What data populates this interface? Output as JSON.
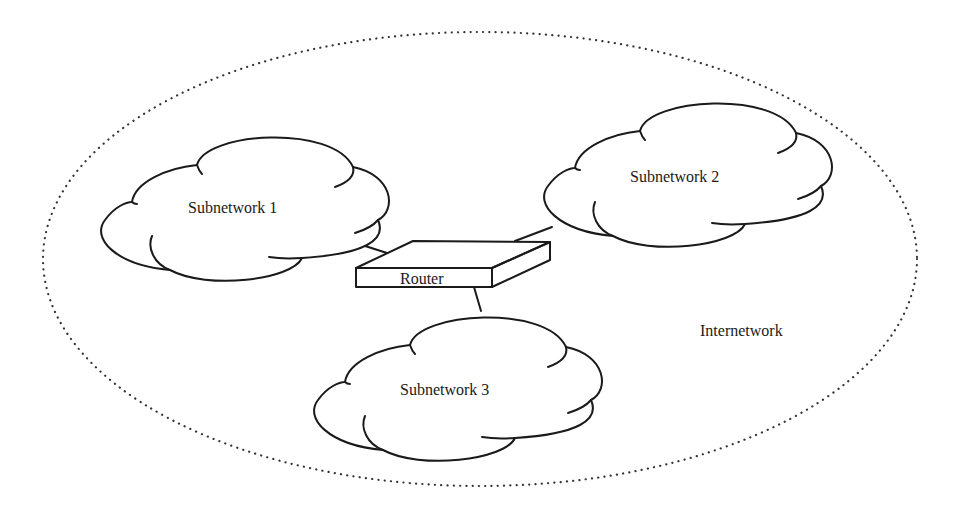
{
  "diagram": {
    "type": "network-topology",
    "boundary": {
      "label": "Internetwork",
      "shape": "dotted-ellipse"
    },
    "clouds": [
      {
        "id": "subnet1",
        "label": "Subnetwork 1"
      },
      {
        "id": "subnet2",
        "label": "Subnetwork 2"
      },
      {
        "id": "subnet3",
        "label": "Subnetwork 3"
      }
    ],
    "router": {
      "label": "Router"
    },
    "connections": [
      {
        "from": "subnet1",
        "to": "router"
      },
      {
        "from": "router",
        "to": "subnet2"
      },
      {
        "from": "router",
        "to": "subnet3"
      }
    ],
    "colors": {
      "line": "#1a1a1a",
      "background": "#ffffff",
      "dotted_border": "#333333"
    }
  }
}
